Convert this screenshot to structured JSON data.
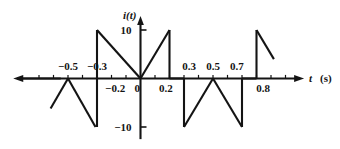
{
  "figure": {
    "kind": "signal-waveform-plot",
    "background_color": "#ffffff",
    "line_color": "#141414",
    "axis_color": "#141414"
  },
  "axes": {
    "y_axis_label": "i(t)",
    "x_axis_label": "t",
    "x_axis_unit": "(s)",
    "y_ticks": [
      {
        "value": 10,
        "label": "10"
      },
      {
        "value": -10,
        "label": "−10"
      }
    ],
    "x_tick_labels_above": [
      {
        "value": -0.5,
        "label": "−0.5"
      },
      {
        "value": -0.3,
        "label": "−0.3"
      },
      {
        "value": 0.3,
        "label": "0.3"
      },
      {
        "value": 0.5,
        "label": "0.5"
      },
      {
        "value": 0.7,
        "label": "0.7"
      }
    ],
    "x_tick_labels_below": [
      {
        "value": -0.2,
        "label": "−0.2"
      },
      {
        "value": 0.0,
        "label": "0"
      },
      {
        "value": 0.2,
        "label": "0.2"
      },
      {
        "value": 0.8,
        "label": "0.8"
      }
    ],
    "x_tick_values": [
      -0.7,
      -0.6,
      -0.5,
      -0.4,
      -0.3,
      -0.2,
      -0.1,
      0.1,
      0.2,
      0.3,
      0.4,
      0.5,
      0.6,
      0.7,
      0.8,
      0.9,
      1.0
    ],
    "x_range": [
      -0.85,
      1.08
    ],
    "y_range": [
      -12.5,
      12.5
    ],
    "origin_label": "0"
  },
  "chart_data": {
    "type": "line",
    "title": "",
    "xlabel": "t",
    "ylabel": "i(t)",
    "xlim": [
      -0.85,
      1.08
    ],
    "ylim": [
      -12.5,
      12.5
    ],
    "grid": false,
    "legend": "none",
    "yticks": [
      -10,
      10
    ],
    "ytick_labels": [
      "−10",
      "10"
    ],
    "xticks": [
      -0.5,
      -0.3,
      -0.2,
      0,
      0.2,
      0.3,
      0.5,
      0.7,
      0.8
    ],
    "xtick_labels": [
      "−0.5",
      "−0.3",
      "−0.2",
      "0",
      "0.2",
      "0.3",
      "0.5",
      "0.7",
      "0.8"
    ],
    "series": [
      {
        "name": "i(t)",
        "x": [
          -0.8,
          -0.7,
          -0.5,
          -0.5,
          -0.3,
          -0.3,
          -0.3,
          0.0,
          0.0,
          0.2,
          0.2,
          0.3,
          0.3,
          0.5,
          0.5,
          0.7,
          0.7,
          0.8,
          0.8,
          1.0
        ],
        "y": [
          0.0,
          -6.0,
          10.0,
          0.0,
          -10.0,
          0.0,
          10.0,
          0.0,
          0.0,
          10.0,
          0.0,
          0.0,
          -10.0,
          0.0,
          0.0,
          -10.0,
          0.0,
          0.0,
          10.0,
          3.0
        ]
      }
    ],
    "segments": [
      {
        "comment": "flat zero on far left",
        "points": [
          [
            -0.85,
            0
          ],
          [
            -0.55,
            0
          ]
        ]
      },
      {
        "comment": "ramp down from peak at -0.5 toward -0.6",
        "points": [
          [
            -0.5,
            0
          ],
          [
            -0.62,
            -6.2
          ]
        ]
      },
      {
        "comment": "ramp down from -0.5 to -0.3 reaching -10",
        "points": [
          [
            -0.5,
            0
          ],
          [
            -0.31,
            -10.0
          ]
        ]
      },
      {
        "comment": "vertical jump at -0.3 from -10 up to +10",
        "points": [
          [
            -0.3,
            -10.0
          ],
          [
            -0.3,
            10.0
          ]
        ]
      },
      {
        "comment": "ramp down from +10 at -0.3 to 0 at 0",
        "points": [
          [
            -0.3,
            10.0
          ],
          [
            0.0,
            0.0
          ]
        ]
      },
      {
        "comment": "ramp up from 0 at 0 to +10 at 0.2",
        "points": [
          [
            0.0,
            0.0
          ],
          [
            0.2,
            10.0
          ]
        ]
      },
      {
        "comment": "vertical drop at 0.2 from +10 to 0",
        "points": [
          [
            0.2,
            10.0
          ],
          [
            0.2,
            0.0
          ]
        ]
      },
      {
        "comment": "flat zero 0.2 to 0.3",
        "points": [
          [
            0.2,
            0.0
          ],
          [
            0.3,
            0.0
          ]
        ]
      },
      {
        "comment": "vertical drop at 0.3 from 0 to -10",
        "points": [
          [
            0.3,
            0.0
          ],
          [
            0.3,
            -10.0
          ]
        ]
      },
      {
        "comment": "ramp up from -10 at 0.3 to 0 at 0.5",
        "points": [
          [
            0.3,
            -10.0
          ],
          [
            0.5,
            0.0
          ]
        ]
      },
      {
        "comment": "ramp down from 0 at 0.5 to -10 at 0.7",
        "points": [
          [
            0.5,
            0.0
          ],
          [
            0.7,
            -10.0
          ]
        ]
      },
      {
        "comment": "vertical rise at 0.7/0.8 from -10 to 0",
        "points": [
          [
            0.7,
            -10.0
          ],
          [
            0.7,
            0.0
          ]
        ]
      },
      {
        "comment": "flat zero 0.7 to 0.8",
        "points": [
          [
            0.7,
            0.0
          ],
          [
            0.8,
            0.0
          ]
        ]
      },
      {
        "comment": "vertical jump at 0.8 from 0 to +10",
        "points": [
          [
            0.8,
            0.0
          ],
          [
            0.8,
            10.0
          ]
        ]
      },
      {
        "comment": "ramp down from +10 at 0.8",
        "points": [
          [
            0.8,
            10.0
          ],
          [
            0.92,
            4.0
          ]
        ]
      }
    ]
  }
}
